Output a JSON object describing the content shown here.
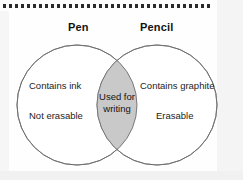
{
  "diagram": {
    "type": "venn",
    "sets": [
      {
        "title": "Pen",
        "items": [
          "Contains ink",
          "Not erasable"
        ]
      },
      {
        "title": "Pencil",
        "items": [
          "Contains graphite",
          "Erasable"
        ]
      }
    ],
    "intersection": {
      "line1": "Used for",
      "line2": "writing"
    },
    "colors": {
      "intersection_fill": "#c9c9c9",
      "circle_fill": "#ffffff",
      "circle_stroke": "#6e6e6e",
      "text": "#121212",
      "dot_rule": "#2b2b2b",
      "page_background": "#fefefe"
    }
  },
  "decoration": {
    "dot_count": 35
  }
}
